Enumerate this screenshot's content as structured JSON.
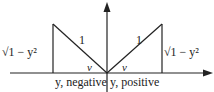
{
  "diagram": {
    "left_triangle": {
      "side_label": "√1 − y²",
      "hypotenuse_label": "1",
      "angle_label": "v"
    },
    "right_triangle": {
      "side_label": "√1 − y²",
      "hypotenuse_label": "1",
      "angle_label": "v"
    },
    "axis_labels": {
      "left": "y, negative",
      "right": "y, positive"
    },
    "colors": {
      "stroke": "#222222",
      "background": "#ffffff"
    }
  }
}
